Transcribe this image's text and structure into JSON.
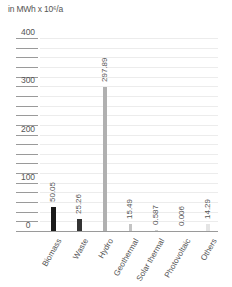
{
  "chart_data": {
    "type": "bar",
    "title": "",
    "unit_label": "in MWh x 10⁶/a",
    "xlabel": "",
    "ylabel": "in MWh x 10⁶/a",
    "ylim": [
      0,
      400
    ],
    "yticks": [
      0,
      100,
      200,
      300,
      400
    ],
    "minor_tick_step": 20,
    "grid": true,
    "legend": null,
    "categories": [
      "Biomass",
      "Waste",
      "Hydro",
      "Geothermal",
      "Solar thermal",
      "Photovoltaic",
      "Others"
    ],
    "values": [
      50.05,
      25.26,
      297.89,
      15.49,
      0.587,
      0.006,
      14.29
    ],
    "value_labels": [
      "50.05",
      "25.26",
      "297.89",
      "15.49",
      "0.587",
      "0.006",
      "14.29"
    ],
    "colors": [
      "#1a1a1a",
      "#333333",
      "#b0b0b0",
      "#c4c4c4",
      "#d0d0d0",
      "#d8d8d8",
      "#e4e4e4"
    ]
  }
}
